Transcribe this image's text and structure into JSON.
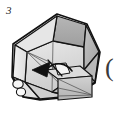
{
  "figure": {
    "step_number": "3",
    "side_mark": "(",
    "background_color": "#ffffff",
    "outline_color": "#141414",
    "thin_line_color": "#4a4a4a",
    "arrow_color": "#111111",
    "palette": {
      "top_face": "#a8a8a8",
      "top_face_light": "#bcbcbc",
      "upper_left_facet": "#e4e4e4",
      "upper_right_facet": "#d2d2d2",
      "left_facet": "#ececec",
      "right_facet": "#b4b4b4",
      "inner_floor": "#dedede",
      "inner_floor_shadow": "#cfcfcf",
      "flap_face": "#c6c6c6",
      "flap_side": "#b0b0b0",
      "tab_white": "#f4f4f4",
      "rim_edge": "#9a9a9a"
    },
    "shapes": {
      "outer_polygon_label": "octagonal-box-body",
      "top_face_label": "back-top-face",
      "inner_cavity_label": "box-interior",
      "flap_label": "folding-flap",
      "arrow_label": "fold-direction-arrow",
      "finger_label": "left-corner-tabs"
    },
    "geometry": {
      "outer_octagon_points": "57,14 88,24 101,52 95,82 68,100 36,99 15,79 13,45",
      "top_face_points": "57,16 86,25 84,47 53,41",
      "upper_left_facet_points": "57,16 53,41 27,52 15,45",
      "upper_right_facet_points": "86,25 99,52 84,70 84,47",
      "left_facet_points": "15,45 27,52 25,82 15,78",
      "right_facet_points": "99,52 95,82 72,96 84,70",
      "bottom_left_facet_points": "25,82 52,92 40,99 25,96",
      "bottom_right_facet_points": "52,92 84,70 95,82 72,96",
      "inner_rim_points": "53,41 84,47 84,70 52,92 25,82 27,52",
      "flap_front_points": "57,78 90,76 90,97 58,99",
      "flap_top_points": "46,70 80,67 90,76 57,78",
      "tab_points": "36,68 58,66 62,78 40,80"
    },
    "arrow": {
      "tail_path": "M 70,70 C 62,66 54,66 47,70",
      "head_points": "46,70 56,64 55,76",
      "label": "fold-arrow"
    }
  }
}
